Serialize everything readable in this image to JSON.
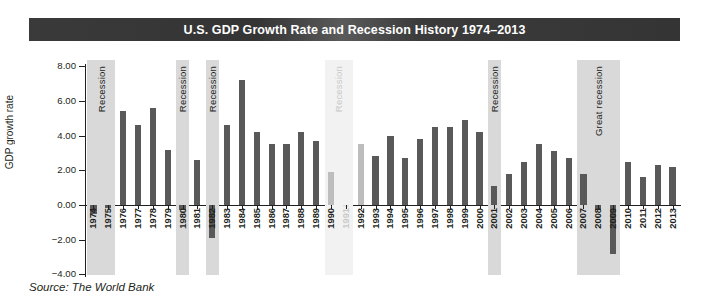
{
  "title": "U.S. GDP Growth Rate and Recession History 1974–2013",
  "source": "Source: The World Bank",
  "axis": {
    "ylabel": "GDP growth rate",
    "yticks": [
      "8.00",
      "6.00",
      "4.00",
      "2.00",
      "0.00",
      "−2.00",
      "−4.00"
    ]
  },
  "recession_label": "Recession",
  "great_recession_label": "Great recession",
  "chart_data": {
    "type": "bar",
    "title": "U.S. GDP Growth Rate and Recession History 1974–2013",
    "xlabel": "",
    "ylabel": "GDP growth rate",
    "ylim": [
      -4.0,
      8.0
    ],
    "ytick_values": [
      8.0,
      6.0,
      4.0,
      2.0,
      0.0,
      -2.0,
      -4.0
    ],
    "grid": false,
    "legend": "none",
    "categories": [
      "1974",
      "1975",
      "1976",
      "1977",
      "1978",
      "1979",
      "1980",
      "1981",
      "1982",
      "1983",
      "1984",
      "1985",
      "1986",
      "1987",
      "1988",
      "1989",
      "1990",
      "1991",
      "1992",
      "1993",
      "1994",
      "1995",
      "1996",
      "1997",
      "1998",
      "1999",
      "2000",
      "2001",
      "2002",
      "2003",
      "2004",
      "2005",
      "2006",
      "2007",
      "2008",
      "2009",
      "2010",
      "2011",
      "2012",
      "2013"
    ],
    "values": [
      -0.5,
      -0.2,
      5.4,
      4.6,
      5.6,
      3.2,
      -0.3,
      2.6,
      -1.9,
      4.6,
      7.2,
      4.2,
      3.5,
      3.5,
      4.2,
      3.7,
      1.9,
      -0.1,
      3.5,
      2.8,
      4.0,
      2.7,
      3.8,
      4.5,
      4.5,
      4.9,
      4.2,
      1.1,
      1.8,
      2.5,
      3.5,
      3.1,
      2.7,
      1.8,
      -0.3,
      -2.8,
      2.5,
      1.6,
      2.3,
      2.2
    ],
    "recessions": [
      {
        "label": "Recession",
        "start_year": 1974,
        "end_year": 1975,
        "style": "normal"
      },
      {
        "label": "Recession",
        "start_year": 1980,
        "end_year": 1980,
        "style": "normal"
      },
      {
        "label": "Recession",
        "start_year": 1982,
        "end_year": 1982,
        "style": "normal"
      },
      {
        "label": "Recession",
        "start_year": 1990,
        "end_year": 1991,
        "style": "faded"
      },
      {
        "label": "Recession",
        "start_year": 2001,
        "end_year": 2001,
        "style": "normal"
      },
      {
        "label": "Great recession",
        "start_year": 2007,
        "end_year": 2009,
        "style": "normal"
      }
    ],
    "source": "Source: The World Bank",
    "bar_color": "#595959",
    "recession_band_color": "#d9d9d9",
    "title_band_color": "#3a3a3a"
  }
}
